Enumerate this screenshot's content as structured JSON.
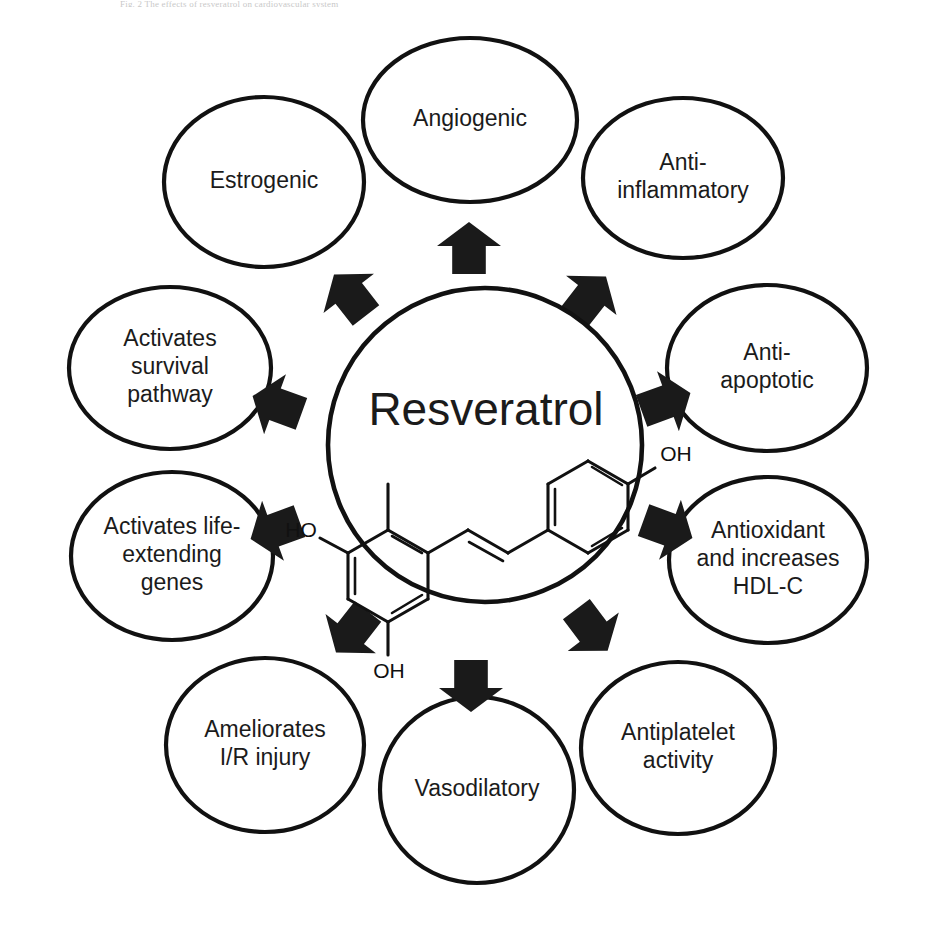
{
  "figure": {
    "header_text": "Fig. 2  The effects of resveratrol on cardiovascular system",
    "center": {
      "label": "Resveratrol",
      "molecule": {
        "name": "trans-resveratrol",
        "labels": [
          "HO",
          "OH",
          "OH"
        ]
      }
    },
    "colors": {
      "stroke": "#111111",
      "fill": "#ffffff",
      "arrow": "#1a1a1a",
      "text": "#1b1b1b"
    },
    "nodes": [
      {
        "id": "angiogenic",
        "lines": [
          "Angiogenic"
        ],
        "cx": 470,
        "cy": 120,
        "rx": 107,
        "ry": 82
      },
      {
        "id": "anti-inflammatory",
        "lines": [
          "Anti-",
          "inflammatory"
        ],
        "cx": 683,
        "cy": 178,
        "rx": 100,
        "ry": 80
      },
      {
        "id": "anti-apoptotic",
        "lines": [
          "Anti-",
          "apoptotic"
        ],
        "cx": 767,
        "cy": 368,
        "rx": 100,
        "ry": 83
      },
      {
        "id": "antioxidant-hdl",
        "lines": [
          "Antioxidant",
          "and increases",
          "HDL-C"
        ],
        "cx": 768,
        "cy": 560,
        "rx": 99,
        "ry": 83
      },
      {
        "id": "antiplatelet",
        "lines": [
          "Antiplatelet",
          "activity"
        ],
        "cx": 678,
        "cy": 748,
        "rx": 97,
        "ry": 86
      },
      {
        "id": "vasodilatory",
        "lines": [
          "Vasodilatory"
        ],
        "cx": 477,
        "cy": 790,
        "rx": 97,
        "ry": 93
      },
      {
        "id": "ameliorates-ir",
        "lines": [
          "Ameliorates",
          "I/R injury"
        ],
        "cx": 265,
        "cy": 745,
        "rx": 99,
        "ry": 87
      },
      {
        "id": "life-extending",
        "lines": [
          "Activates life-",
          "extending",
          "genes"
        ],
        "cx": 172,
        "cy": 556,
        "rx": 101,
        "ry": 84
      },
      {
        "id": "survival-pathway",
        "lines": [
          "Activates",
          "survival",
          "pathway"
        ],
        "cx": 170,
        "cy": 368,
        "rx": 101,
        "ry": 81
      },
      {
        "id": "estrogenic",
        "lines": [
          "Estrogenic"
        ],
        "cx": 264,
        "cy": 182,
        "rx": 100,
        "ry": 85
      }
    ],
    "arrows": [
      {
        "id": "arrow-to-angiogenic",
        "cx": 469,
        "cy": 248,
        "angle": 0,
        "len": 52,
        "w": 40
      },
      {
        "id": "arrow-to-anti-inflammatory",
        "cx": 590,
        "cy": 297,
        "angle": 38,
        "len": 52,
        "w": 40
      },
      {
        "id": "arrow-to-anti-apoptotic",
        "cx": 666,
        "cy": 402,
        "angle": 70,
        "len": 52,
        "w": 40
      },
      {
        "id": "arrow-to-antioxidant",
        "cx": 668,
        "cy": 529,
        "angle": 110,
        "len": 52,
        "w": 40
      },
      {
        "id": "arrow-to-antiplatelet",
        "cx": 592,
        "cy": 630,
        "angle": 143,
        "len": 52,
        "w": 40
      },
      {
        "id": "arrow-to-vasodilatory",
        "cx": 471,
        "cy": 686,
        "angle": 180,
        "len": 52,
        "w": 40
      },
      {
        "id": "arrow-to-ameliorates",
        "cx": 352,
        "cy": 632,
        "angle": 218,
        "len": 52,
        "w": 40
      },
      {
        "id": "arrow-to-life-extending",
        "cx": 275,
        "cy": 530,
        "angle": 250,
        "len": 52,
        "w": 40
      },
      {
        "id": "arrow-to-survival",
        "cx": 277,
        "cy": 405,
        "angle": 290,
        "len": 52,
        "w": 40
      },
      {
        "id": "arrow-to-estrogenic",
        "cx": 350,
        "cy": 295,
        "angle": 322,
        "len": 52,
        "w": 40
      }
    ]
  }
}
